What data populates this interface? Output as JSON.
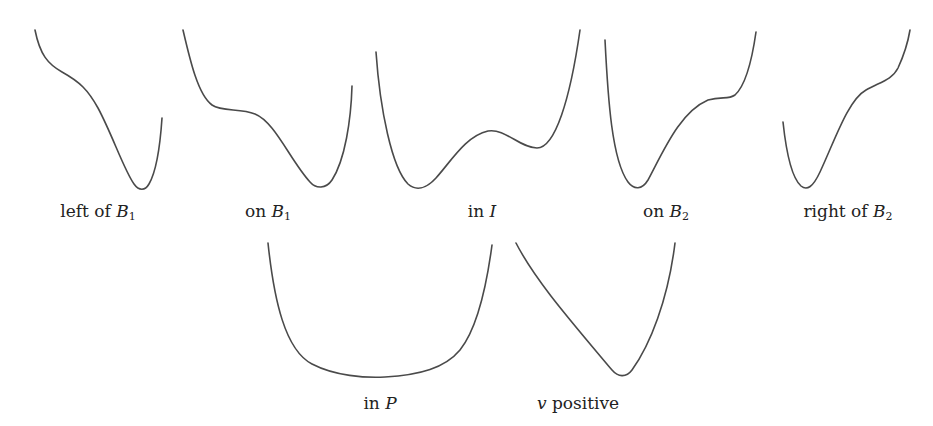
{
  "figure": {
    "stroke_color": "#4a4a4a",
    "panels": [
      {
        "id": "left-of-b1",
        "label_prefix": "left of ",
        "label_math": "B",
        "label_sub": "1",
        "label_suffix": "",
        "label_pos": [
          98,
          201
        ],
        "path": "M35,30 C40,55 48,64 62,72 C80,82 88,90 98,108 C112,134 124,170 134,184 C139,191 145,191 149,184 C156,172 160,148 162,118"
      },
      {
        "id": "on-b1",
        "label_prefix": "on ",
        "label_math": "B",
        "label_sub": "1",
        "label_suffix": "",
        "label_pos": [
          268,
          201
        ],
        "path": "M183,30 C190,60 198,95 212,105 C222,112 240,108 255,114 C275,122 290,160 310,182 C316,189 326,189 332,180 C345,160 351,120 352,86"
      },
      {
        "id": "in-i",
        "label_prefix": "in ",
        "label_math": "I",
        "label_sub": "",
        "label_suffix": "",
        "label_pos": [
          482,
          201
        ],
        "path": "M376,52 C380,110 392,168 408,184 C416,191 426,189 436,178 C452,160 466,136 488,131 C505,128 520,148 537,148 C555,148 570,100 580,30"
      },
      {
        "id": "on-b2",
        "label_prefix": "on ",
        "label_math": "B",
        "label_sub": "2",
        "label_suffix": "",
        "label_pos": [
          666,
          201
        ],
        "path": "M605,40 C608,100 612,160 628,182 C634,190 642,190 648,180 C664,150 680,112 708,100 C722,96 728,100 735,95 C746,85 752,60 756,32"
      },
      {
        "id": "right-of-b2",
        "label_prefix": "right of ",
        "label_math": "B",
        "label_sub": "2",
        "label_suffix": "",
        "label_pos": [
          848,
          201
        ],
        "path": "M783,122 C786,150 792,178 801,186 C807,191 813,187 820,172 C835,140 848,100 866,90 C880,82 892,80 898,68 C904,55 908,42 910,30"
      },
      {
        "id": "in-p",
        "label_prefix": "in ",
        "label_math": "P",
        "label_sub": "",
        "label_suffix": "",
        "label_pos": [
          380,
          393
        ],
        "path": "M268,243 C274,300 285,350 312,364 C335,376 365,378 385,377 C420,375 445,368 460,350 C476,330 486,290 492,245"
      },
      {
        "id": "v-positive",
        "label_prefix": "",
        "label_math": "v",
        "label_sub": "",
        "label_suffix": " positive",
        "label_pos": [
          578,
          393
        ],
        "path": "M516,243 C535,280 570,320 612,370 C618,377 626,378 632,370 C650,345 668,300 675,243"
      }
    ]
  }
}
